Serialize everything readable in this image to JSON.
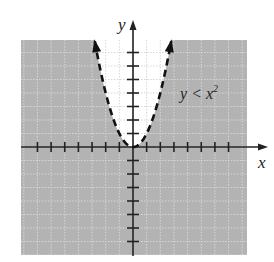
{
  "chart_data": {
    "type": "line",
    "title": "",
    "xlabel": "x",
    "ylabel": "y",
    "annotation": {
      "text_base": "y < x",
      "superscript": "2",
      "full": "y < x^2"
    },
    "function": "y = x^2",
    "boundary_style": "dashed",
    "shaded_region": "y < x^2 (outside the parabola)",
    "xlim": [
      -8.3,
      8.3
    ],
    "ylim": [
      -8,
      8
    ],
    "x_ticks": [
      -7,
      -6,
      -5,
      -4,
      -3,
      -2,
      -1,
      1,
      2,
      3,
      4,
      5,
      6,
      7
    ],
    "y_ticks": [
      -7,
      -6,
      -5,
      -4,
      -3,
      -2,
      -1,
      1,
      2,
      3,
      4,
      5,
      6,
      7
    ],
    "tick_labels_shown": false,
    "grid": true,
    "legend": null,
    "series": [
      {
        "name": "y = x^2",
        "x": [
          -2.8,
          -2.5,
          -2,
          -1.5,
          -1,
          -0.5,
          0,
          0.5,
          1,
          1.5,
          2,
          2.5,
          2.8
        ],
        "y": [
          7.84,
          6.25,
          4,
          2.25,
          1,
          0.25,
          0,
          0.25,
          1,
          2.25,
          4,
          6.25,
          7.84
        ]
      }
    ],
    "colors": {
      "shade": "#b3b3b3",
      "unshaded": "#ffffff",
      "grid_on_shade": "#d6d6d6",
      "grid_on_white": "#cfcfcf",
      "axes": "#222222",
      "curve": "#111111"
    }
  }
}
